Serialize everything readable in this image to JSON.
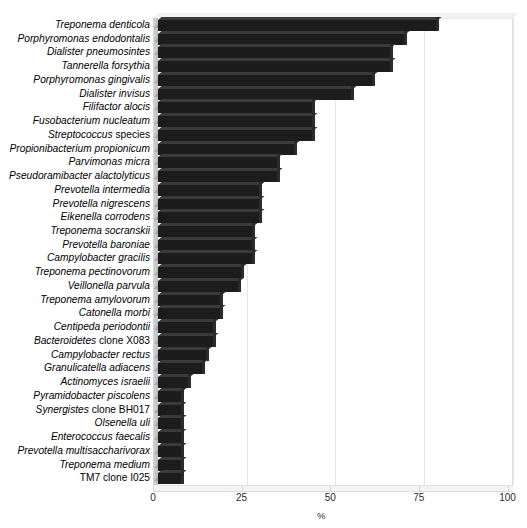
{
  "chart_data": {
    "type": "bar",
    "orientation": "horizontal",
    "title": "",
    "xlabel": "%",
    "ylabel": "",
    "xlim": [
      0,
      100
    ],
    "xticks": [
      0,
      25,
      50,
      75,
      100
    ],
    "grid": true,
    "legend": null,
    "bar_color": "#1c1c1c",
    "categories": [
      "Treponema denticola",
      "Porphyromonas endodontalis",
      "Dialister pneumosintes",
      "Tannerella forsythia",
      "Porphyromonas gingivalis",
      "Dialister invisus",
      "Filifactor alocis",
      "Fusobacterium nucleatum",
      "Streptococcus species",
      "Propionibacterium propionicum",
      "Parvimonas micra",
      "Pseudoramibacter alactolyticus",
      "Prevotella intermedia",
      "Prevotella nigrescens",
      "Eikenella corrodens",
      "Treponema socranskii",
      "Prevotella baroniae",
      "Campylobacter gracilis",
      "Treponema pectinovorum",
      "Veillonella parvula",
      "Treponema amylovorum",
      "Catonella morbi",
      "Centipeda periodontii",
      "Bacteroidetes clone X083",
      "Campylobacter rectus",
      "Granulicatella adiacens",
      "Actinomyces israelii",
      "Pyramidobacter piscolens",
      "Synergistes clone BH017",
      "Olsenella uli",
      "Enterococcus faecalis",
      "Prevotella multisaccharivorax",
      "Treponema medium",
      "TM7 clone I025"
    ],
    "values": [
      79,
      70,
      66,
      66,
      61,
      55,
      44,
      44,
      44,
      39,
      34,
      34,
      29,
      29,
      29,
      27,
      27,
      27,
      24,
      23,
      18,
      18,
      16,
      16,
      14,
      13,
      9,
      7,
      7,
      7,
      7,
      7,
      7,
      7
    ],
    "category_italic_prefix_words": {
      "Streptococcus species": 1,
      "Bacteroidetes clone X083": 1,
      "Synergistes clone BH017": 1,
      "TM7 clone I025": 0
    }
  },
  "axis": {
    "tick_labels": [
      "0",
      "25",
      "50",
      "75",
      "100"
    ],
    "x_title": "%"
  }
}
